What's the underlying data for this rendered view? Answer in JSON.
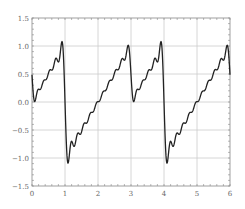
{
  "chart_data": {
    "type": "line",
    "title": "",
    "xlabel": "",
    "ylabel": "",
    "xlim": [
      0,
      6
    ],
    "ylim": [
      -1.5,
      1.5
    ],
    "grid": true,
    "legend": null,
    "x_ticks": [
      0,
      1,
      2,
      3,
      4,
      5,
      6
    ],
    "x_tick_labels": [
      "0",
      "1",
      "2",
      "3",
      "4",
      "5",
      "6"
    ],
    "y_ticks": [
      -1.5,
      -1.0,
      -0.5,
      0.0,
      0.5,
      1.0,
      1.5
    ],
    "y_tick_labels": [
      "−1.5",
      "−1.0",
      "−0.5",
      "0.0",
      "0.5",
      "1.0",
      "1.5"
    ],
    "series": [
      {
        "name": "Fourier partial sum",
        "description": "Truncated Fourier series (Gibbs ripples) of a period-3 piecewise-linear sawtooth: f(x)=x on [0,1), f(x)=x-2 on [1,3)",
        "period": 3,
        "harmonics": 15,
        "color": "#222222",
        "key_points": [
          [
            0.0,
            0.5
          ],
          [
            0.05,
            0.0
          ],
          [
            0.5,
            0.45
          ],
          [
            0.95,
            1.1
          ],
          [
            1.0,
            0.0
          ],
          [
            1.07,
            -1.1
          ],
          [
            1.5,
            -0.5
          ],
          [
            2.0,
            0.0
          ],
          [
            2.5,
            0.5
          ],
          [
            2.95,
            1.1
          ],
          [
            3.0,
            0.5
          ],
          [
            3.05,
            0.0
          ],
          [
            3.5,
            0.45
          ],
          [
            3.95,
            1.1
          ],
          [
            4.0,
            0.0
          ],
          [
            4.07,
            -1.1
          ],
          [
            4.5,
            -0.5
          ],
          [
            5.0,
            0.0
          ],
          [
            5.5,
            0.5
          ],
          [
            5.95,
            1.1
          ],
          [
            6.0,
            0.5
          ]
        ]
      }
    ],
    "colors": {
      "line": "#222222",
      "grid": "#cccccc",
      "axis": "#888888",
      "tick_label": "#666666"
    }
  }
}
